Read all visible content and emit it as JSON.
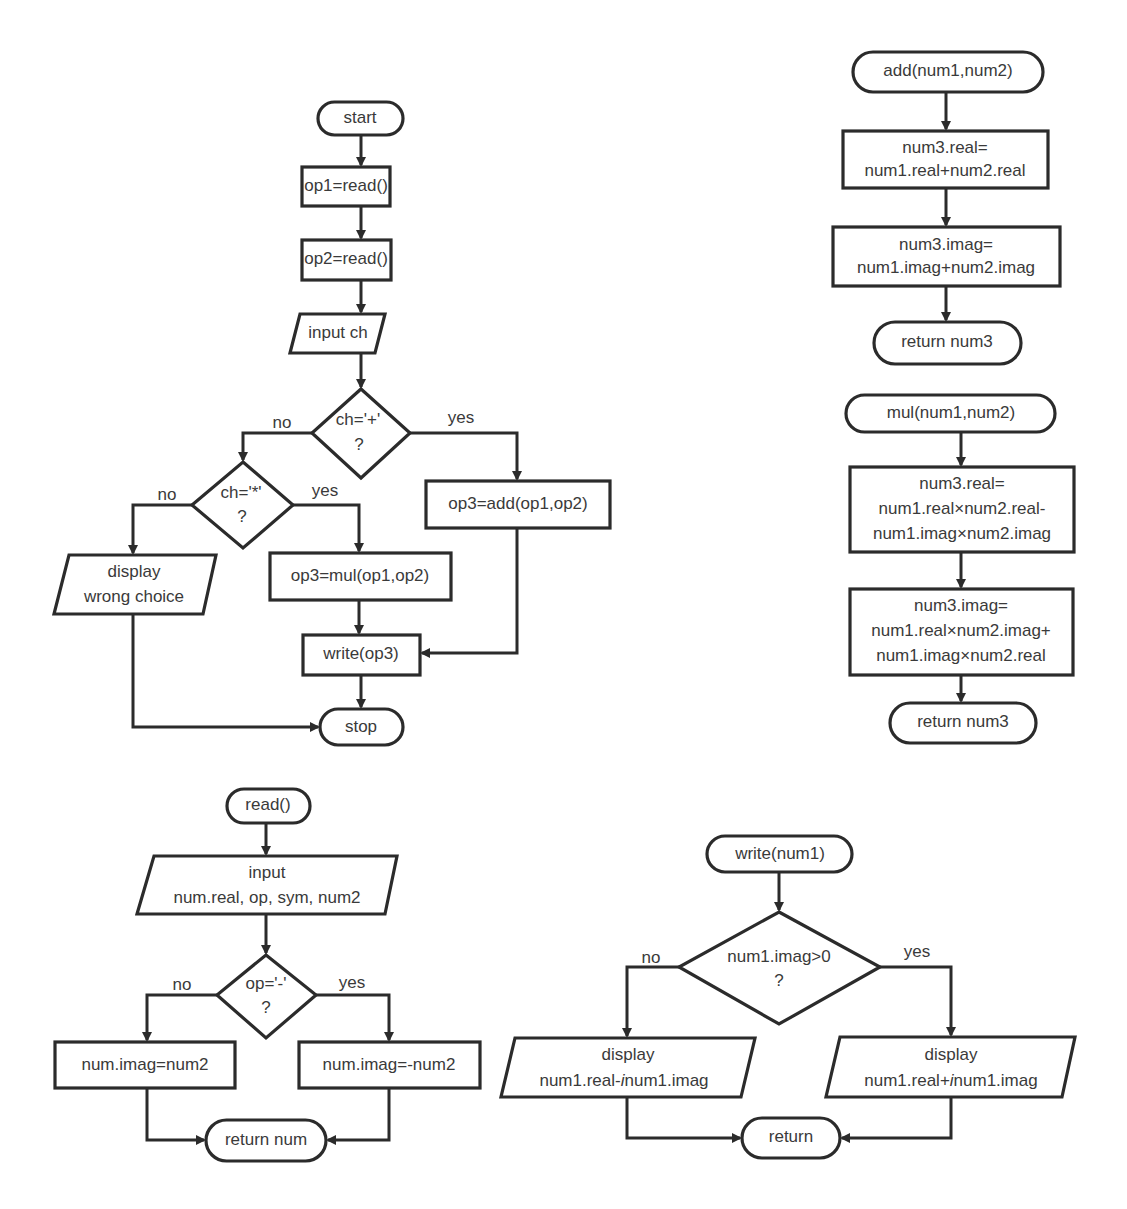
{
  "main_flow": {
    "start": "start",
    "op1": "op1=read()",
    "op2": "op2=read()",
    "input": "input ch",
    "dec_plus": {
      "line1": "ch='+'",
      "line2": "?",
      "no": "no",
      "yes": "yes"
    },
    "dec_mul": {
      "line1": "ch='*'",
      "line2": "?",
      "no": "no",
      "yes": "yes"
    },
    "add": "op3=add(op1,op2)",
    "mul": "op3=mul(op1,op2)",
    "wrong": {
      "line1": "display",
      "line2": "wrong choice"
    },
    "write": "write(op3)",
    "stop": "stop"
  },
  "add_flow": {
    "start": "add(num1,num2)",
    "real": {
      "line1": "num3.real=",
      "line2": "num1.real+num2.real"
    },
    "imag": {
      "line1": "num3.imag=",
      "line2": "num1.imag+num2.imag"
    },
    "ret": "return num3"
  },
  "mul_flow": {
    "start": "mul(num1,num2)",
    "real": {
      "line1": "num3.real=",
      "line2": "num1.real×num2.real-",
      "line3": "num1.imag×num2.imag"
    },
    "imag": {
      "line1": "num3.imag=",
      "line2": "num1.real×num2.imag+",
      "line3": "num1.imag×num2.real"
    },
    "ret": "return num3"
  },
  "read_flow": {
    "start": "read()",
    "input": {
      "line1": "input",
      "line2": "num.real, op, sym, num2"
    },
    "dec": {
      "line1": "op='-'",
      "line2": "?",
      "no": "no",
      "yes": "yes"
    },
    "no_box": "num.imag=num2",
    "yes_box": "num.imag=-num2",
    "ret": "return num"
  },
  "write_flow": {
    "start": "write(num1)",
    "dec": {
      "line1": "num1.imag>0",
      "line2": "?",
      "no": "no",
      "yes": "yes"
    },
    "no_disp": {
      "line1": "display",
      "line2": "num1.real-",
      "italic": "i",
      "line2b": "num1.imag"
    },
    "yes_disp": {
      "line1": "display",
      "line2": "num1.real+",
      "italic": "i",
      "line2b": "num1.imag"
    },
    "ret": "return"
  }
}
